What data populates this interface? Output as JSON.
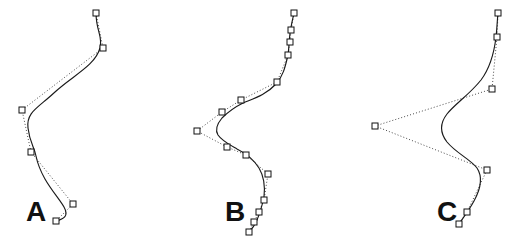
{
  "figure": {
    "width": 518,
    "height": 242,
    "background_color": "#ffffff",
    "curve_color": "#1a1a1a",
    "polygon_color": "#4a4a4a",
    "point_fill_color": "#ffffff",
    "point_stroke_color": "#111111",
    "label_color": "#111111"
  },
  "panels": [
    {
      "id": "panel-a",
      "label": "A",
      "label_x": 26,
      "label_y": 221,
      "point_count": 6
    },
    {
      "id": "panel-b",
      "label": "B",
      "label_x": 225,
      "label_y": 221,
      "point_count": 14
    },
    {
      "id": "panel-c",
      "label": "C",
      "label_x": 437,
      "label_y": 221,
      "point_count": 7
    }
  ],
  "chart_data": {
    "type": "scatter",
    "title": "",
    "xlabel": "",
    "ylabel": "",
    "grid": false,
    "legend": "none",
    "xlim": [
      0,
      518
    ],
    "ylim": [
      242,
      0
    ],
    "series": [
      {
        "name": "A",
        "marker": "square-open",
        "control_points": [
          [
            96,
            13
          ],
          [
            103,
            48
          ],
          [
            22,
            110
          ],
          [
            31,
            152
          ],
          [
            73,
            204
          ],
          [
            56,
            221
          ]
        ],
        "curve_path": "M 96 13 C 96 31 103 36 100 48 C 95 66 72 76 55 92 C 38 108 26 112 28 128 C 30 144 34 146 36 156 C 41 180 58 196 64 207 C 69 216 64 219 56 221"
      },
      {
        "name": "B",
        "marker": "square-open",
        "control_points": [
          [
            294,
            13
          ],
          [
            291,
            30
          ],
          [
            290,
            42
          ],
          [
            288,
            55
          ],
          [
            277,
            82
          ],
          [
            241,
            100
          ],
          [
            222,
            112
          ],
          [
            197,
            131
          ],
          [
            227,
            147
          ],
          [
            246,
            155
          ],
          [
            268,
            174
          ],
          [
            264,
            200
          ],
          [
            259,
            212
          ],
          [
            254,
            222
          ],
          [
            249,
            232
          ]
        ],
        "curve_path": "M 294 13 C 292 22 291 26 290 33 C 289 42 289 48 288 55 C 285 68 283 76 276 84 C 266 95 252 99 243 103 C 233 108 227 113 222 118 C 217 124 215 130 218 135 C 222 141 230 145 237 149 C 245 153 254 160 259 168 C 265 178 265 188 264 197 C 262 206 260 213 257 220 C 254 227 251 230 249 232"
      },
      {
        "name": "C",
        "marker": "square-open",
        "control_points": [
          [
            498,
            13
          ],
          [
            497,
            37
          ],
          [
            492,
            89
          ],
          [
            375,
            126
          ],
          [
            487,
            170
          ],
          [
            467,
            212
          ],
          [
            459,
            224
          ]
        ],
        "curve_path": "M 498 13 C 497 23 497 29 496 37 C 494 54 490 68 481 80 C 470 94 455 104 447 114 C 440 123 440 133 447 142 C 456 153 470 159 477 168 C 483 177 480 190 474 201 C 468 212 462 219 459 224"
      }
    ]
  }
}
